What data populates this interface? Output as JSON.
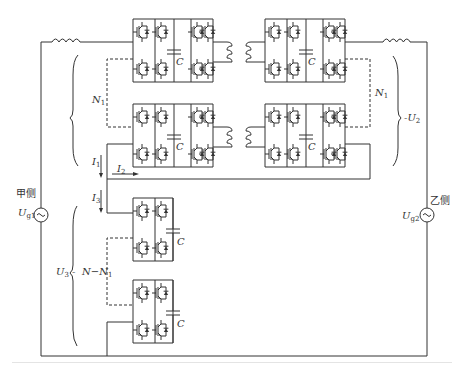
{
  "diagram": {
    "type": "circuit-schematic",
    "stroke_color": "#333333",
    "background": "#ffffff"
  },
  "labels": {
    "capacitor": "C",
    "n1_left": "N",
    "n1_left_sub": "1",
    "n1_right": "N",
    "n1_right_sub": "1",
    "u2": "U",
    "u2_sub": "2",
    "u3": "U",
    "u3_sub": "3",
    "n_minus_n1": "N−N",
    "n_minus_n1_sub": "1",
    "i1": "I",
    "i1_sub": "1",
    "i2": "I",
    "i2_sub": "2",
    "i3": "I",
    "i3_sub": "3",
    "side_a": "甲侧",
    "side_b": "乙侧",
    "ug1": "U",
    "ug1_sub": "g1",
    "ug2": "U",
    "ug2_sub": "g2",
    "ac_symbol": "~"
  },
  "components": {
    "ac_sources": [
      {
        "name": "Ug1",
        "side": "甲侧"
      },
      {
        "name": "Ug2",
        "side": "乙侧"
      }
    ],
    "inductors": 2,
    "h_bridge_modules": 4,
    "half_bridge_modules": 2,
    "transformers": 2,
    "capacitors": 6
  }
}
